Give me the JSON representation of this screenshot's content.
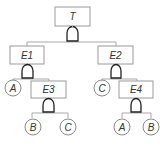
{
  "diagram": {
    "type": "fault-tree",
    "nodes": {
      "top": {
        "label": "T",
        "kind": "event",
        "gate": "AND"
      },
      "e1": {
        "label": "E1",
        "kind": "event",
        "gate": "AND"
      },
      "e2": {
        "label": "E2",
        "kind": "event",
        "gate": "AND"
      },
      "e3": {
        "label": "E3",
        "kind": "event",
        "gate": "AND"
      },
      "e4": {
        "label": "E4",
        "kind": "event",
        "gate": "AND"
      },
      "e1_basic_a": {
        "label": "A",
        "kind": "basic-event"
      },
      "e3_basic_b": {
        "label": "B",
        "kind": "basic-event"
      },
      "e3_basic_c": {
        "label": "C",
        "kind": "basic-event"
      },
      "e2_basic_c": {
        "label": "C",
        "kind": "basic-event"
      },
      "e4_basic_a": {
        "label": "A",
        "kind": "basic-event"
      },
      "e4_basic_b": {
        "label": "B",
        "kind": "basic-event"
      }
    },
    "edges": [
      [
        "T",
        "E1"
      ],
      [
        "T",
        "E2"
      ],
      [
        "E1",
        "A"
      ],
      [
        "E1",
        "E3"
      ],
      [
        "E3",
        "B"
      ],
      [
        "E3",
        "C"
      ],
      [
        "E2",
        "C"
      ],
      [
        "E2",
        "E4"
      ],
      [
        "E4",
        "A"
      ],
      [
        "E4",
        "B"
      ]
    ]
  }
}
